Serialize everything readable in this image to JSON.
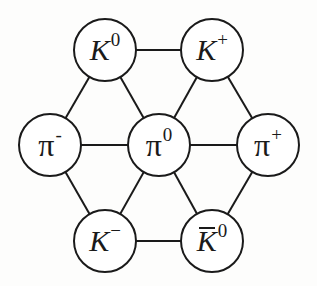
{
  "diagram": {
    "title": "",
    "colors": {
      "stroke": "#1a1a1a",
      "fill": "#ffffff",
      "background": "#fdfdfc"
    },
    "nodes": [
      {
        "id": "K0",
        "symbol": "K",
        "superscript": "0",
        "overbar": false,
        "greek": false,
        "x": 105,
        "y": 50
      },
      {
        "id": "Kplus",
        "symbol": "K",
        "superscript": "+",
        "overbar": false,
        "greek": false,
        "x": 212,
        "y": 50
      },
      {
        "id": "piminus",
        "symbol": "π",
        "superscript": "-",
        "overbar": false,
        "greek": true,
        "x": 50,
        "y": 145
      },
      {
        "id": "pi0",
        "symbol": "π",
        "superscript": "0",
        "overbar": false,
        "greek": true,
        "x": 159,
        "y": 145
      },
      {
        "id": "piplus",
        "symbol": "π",
        "superscript": "+",
        "overbar": false,
        "greek": true,
        "x": 268,
        "y": 145
      },
      {
        "id": "Kminus",
        "symbol": "K",
        "superscript": "−",
        "overbar": false,
        "greek": false,
        "x": 105,
        "y": 241
      },
      {
        "id": "K0bar",
        "symbol": "K",
        "superscript": "0",
        "overbar": true,
        "greek": false,
        "x": 212,
        "y": 241
      }
    ],
    "edges": [
      [
        "K0",
        "Kplus"
      ],
      [
        "K0",
        "piminus"
      ],
      [
        "K0",
        "pi0"
      ],
      [
        "Kplus",
        "pi0"
      ],
      [
        "Kplus",
        "piplus"
      ],
      [
        "piminus",
        "pi0"
      ],
      [
        "pi0",
        "piplus"
      ],
      [
        "piminus",
        "Kminus"
      ],
      [
        "pi0",
        "Kminus"
      ],
      [
        "pi0",
        "K0bar"
      ],
      [
        "piplus",
        "K0bar"
      ],
      [
        "Kminus",
        "K0bar"
      ]
    ],
    "node_radius": 31
  }
}
